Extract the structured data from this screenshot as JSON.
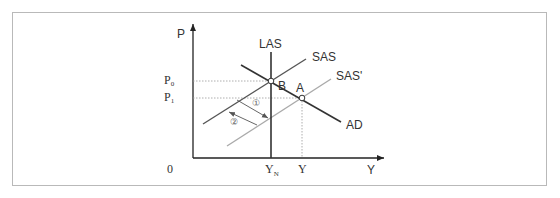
{
  "diagram": {
    "title": "",
    "axes": {
      "y_label": "P",
      "x_label": "Y",
      "origin_label": "0"
    },
    "price_levels": [
      {
        "label": "P",
        "subscript": "0",
        "y": 81
      },
      {
        "label": "P",
        "subscript": "1",
        "y": 98
      }
    ],
    "output_levels": [
      {
        "label": "Y",
        "subscript": "N",
        "x": 271
      },
      {
        "label": "Y",
        "subscript": "",
        "x": 302
      }
    ],
    "curves": [
      {
        "name": "LAS",
        "label": "LAS",
        "color": "#333333"
      },
      {
        "name": "SAS",
        "label": "SAS",
        "color": "#555555"
      },
      {
        "name": "SAS'",
        "label": "SAS'",
        "color": "#aaaaaa"
      },
      {
        "name": "AD",
        "label": "AD",
        "color": "#333333"
      }
    ],
    "points": [
      {
        "label": "B",
        "x": 271,
        "y": 81
      },
      {
        "label": "A",
        "x": 302,
        "y": 98
      }
    ],
    "arrows": [
      {
        "label": "①",
        "direction": "SAS to SAS'"
      },
      {
        "label": "②",
        "direction": "SAS' to SAS"
      }
    ]
  }
}
